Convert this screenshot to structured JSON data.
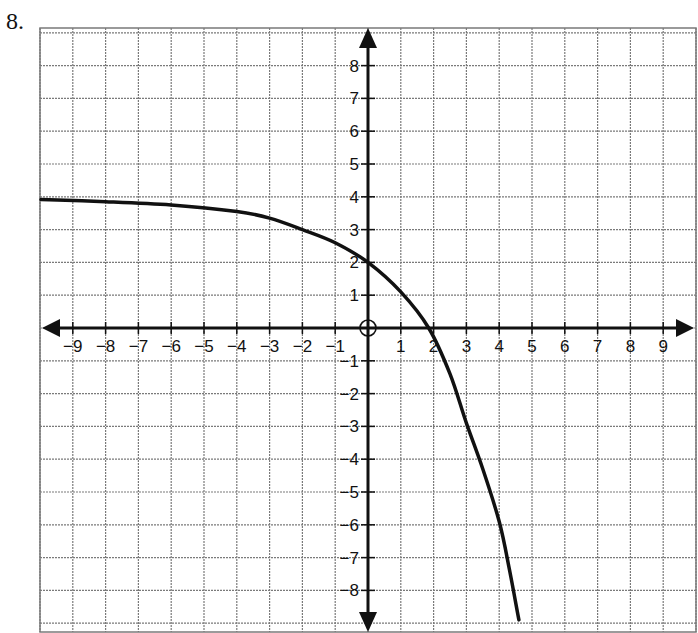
{
  "problem": {
    "number": "8."
  },
  "chart_data": {
    "type": "line",
    "title": "",
    "xlabel": "",
    "ylabel": "",
    "xlim": [
      -10,
      10
    ],
    "ylim": [
      -9,
      9
    ],
    "grid": true,
    "x_ticks": [
      "-9",
      "-8",
      "-7",
      "-6",
      "-5",
      "-4",
      "-3",
      "-2",
      "-1",
      "1",
      "2",
      "3",
      "4",
      "5",
      "6",
      "7",
      "8",
      "9"
    ],
    "y_ticks": [
      "8",
      "7",
      "6",
      "5",
      "4",
      "3",
      "2",
      "1",
      "-1",
      "-2",
      "-3",
      "-4",
      "-5",
      "-6",
      "-7",
      "-8"
    ],
    "series": [
      {
        "name": "curve",
        "description": "Decreasing exponential-type curve with horizontal asymptote y = 4, y-intercept 2, x-intercept about 1.85",
        "x": [
          -10,
          -8,
          -6,
          -4,
          -3,
          -2,
          -1,
          0,
          1,
          1.85,
          2.5,
          3,
          3.5,
          4,
          4.3,
          4.6
        ],
        "y": [
          3.92,
          3.85,
          3.75,
          3.55,
          3.35,
          3.0,
          2.6,
          2.0,
          1.1,
          0.0,
          -1.4,
          -2.9,
          -4.3,
          -5.9,
          -7.3,
          -8.9
        ]
      }
    ],
    "asymptote": {
      "y": 4
    },
    "annotations": []
  },
  "colors": {
    "grid": "#7a7a7a",
    "axis": "#111111",
    "curve": "#111111"
  }
}
